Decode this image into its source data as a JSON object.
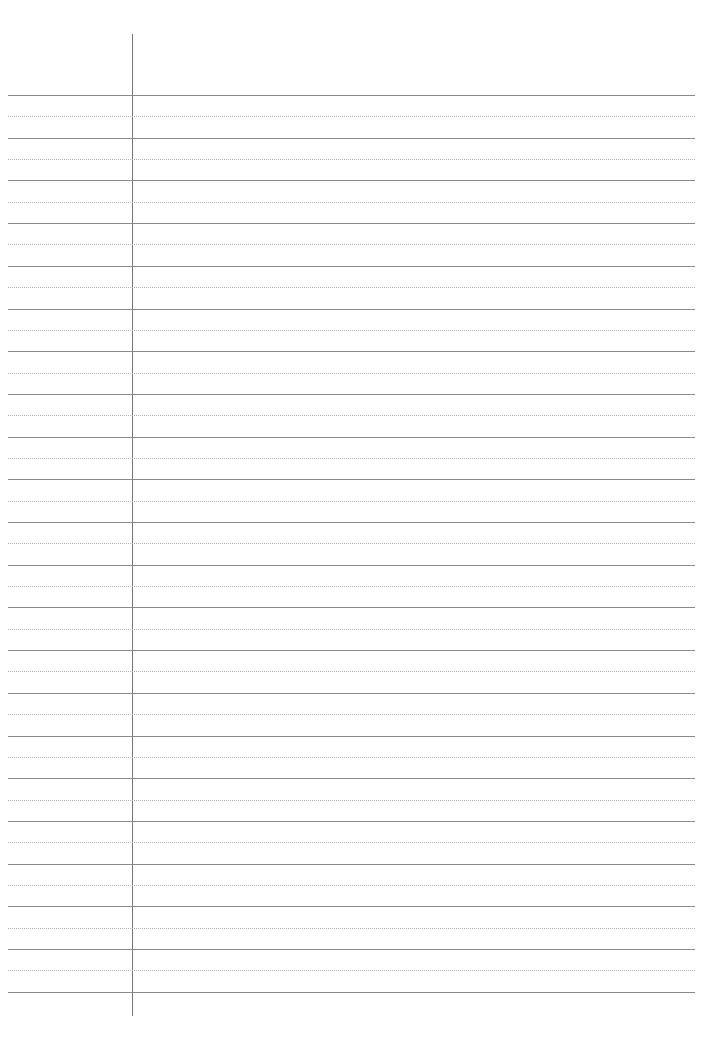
{
  "page": {
    "type": "lined-notes-paper",
    "layout": "cornell-cue-column",
    "colors": {
      "solid_line": "#8a8a8a",
      "dotted_line": "#b0b0b0",
      "margin_line": "#777777",
      "background": "#ffffff"
    },
    "ruling": {
      "first_line_y": 95,
      "line_spacing": 42.7,
      "solid_line_count": 22,
      "dotted_line_count": 21
    },
    "cue_column": {
      "x": 132,
      "top": 34,
      "bottom": 1016
    },
    "text": []
  }
}
